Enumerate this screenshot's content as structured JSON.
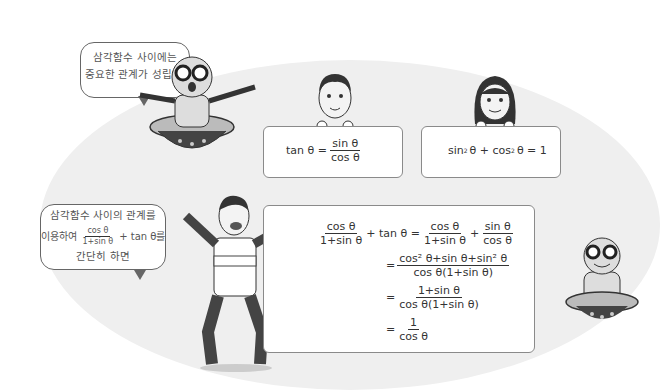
{
  "bubbles": {
    "top": {
      "line1": "삼각함수 사이에는",
      "line2": "중요한 관계가 성립해."
    },
    "left": {
      "line1": "삼각함수 사이의 관계를",
      "line2_prefix": "이용하여",
      "frac_num": "cos θ",
      "frac_den": "1+sin θ",
      "line2_suffix": "+ tan θ를",
      "line3": "간단히 하면"
    }
  },
  "boxes": {
    "tan_identity": {
      "lhs": "tan θ =",
      "num": "sin θ",
      "den": "cos θ"
    },
    "pythagorean": {
      "text_a": "sin",
      "text_b": "θ + cos",
      "text_c": "θ = 1",
      "exp": "2"
    }
  },
  "derivation": {
    "line1": {
      "f1_num": "cos θ",
      "f1_den": "1+sin θ",
      "mid": "+ tan θ =",
      "f2_num": "cos θ",
      "f2_den": "1+sin θ",
      "plus": "+",
      "f3_num": "sin θ",
      "f3_den": "cos θ"
    },
    "line2": {
      "eq": "=",
      "num": "cos² θ+sin θ+sin² θ",
      "den": "cos θ(1+sin θ)"
    },
    "line3": {
      "eq": "=",
      "num": "1+sin θ",
      "den": "cos θ(1+sin θ)"
    },
    "line4": {
      "eq": "=",
      "num": "1",
      "den": "cos θ"
    }
  },
  "colors": {
    "background_blob": "#efefef",
    "box_border": "#8a8a8a",
    "text": "#333333"
  }
}
